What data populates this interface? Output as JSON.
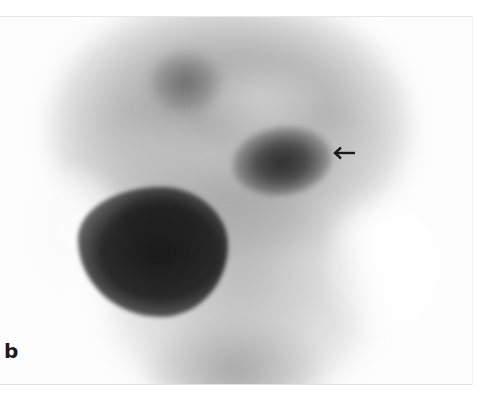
{
  "figure": {
    "panel_label": "b",
    "annotations": [
      {
        "type": "arrow",
        "direction": "left",
        "points_to": "focal uptake lesion",
        "color": "#1a1a1a"
      }
    ],
    "colors": {
      "background": "#ffffff",
      "label": "#1a1a1a",
      "dark_uptake": "#232323"
    }
  }
}
